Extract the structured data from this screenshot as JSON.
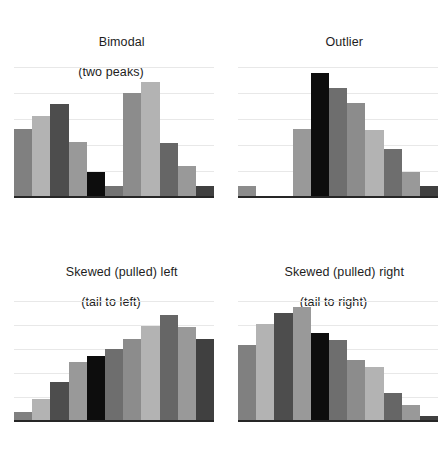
{
  "figure": {
    "background": "#ffffff",
    "axis_color": "#262626",
    "gridline_color": "#e8e8e8",
    "text_color": "#1d1d1d"
  },
  "palette": {
    "medium_gray": "#808080",
    "light_gray": "#b3b3b3",
    "dark_gray": "#4d4d4d",
    "black": "#0d0d0d"
  },
  "panels": [
    {
      "id": "bimodal",
      "title_line1": "Bimodal",
      "title_line2": "(two peaks)"
    },
    {
      "id": "outlier",
      "title_line1": "Outlier",
      "title_line2": ""
    },
    {
      "id": "skewed-left",
      "title_line1": "Skewed (pulled) left",
      "title_line2": "(tail to left)"
    },
    {
      "id": "skewed-right",
      "title_line1": "Skewed (pulled) right",
      "title_line2": "(tail to right)"
    }
  ],
  "chart_data": [
    {
      "type": "bar",
      "id": "bimodal",
      "title": "Bimodal (two peaks)",
      "xlabel": "",
      "ylabel": "",
      "ylim": [
        0,
        100
      ],
      "grid": true,
      "gridline_values": [
        20,
        40,
        60,
        80,
        100
      ],
      "legend": "none",
      "categories": [
        "1",
        "2",
        "3",
        "4",
        "5",
        "6",
        "7",
        "8",
        "9",
        "10"
      ],
      "values": [
        53,
        63,
        72,
        43,
        20,
        9,
        81,
        89,
        42,
        25,
        9
      ],
      "bars": [
        {
          "index": 1,
          "value": 53,
          "color": "#808080"
        },
        {
          "index": 2,
          "value": 63,
          "color": "#b3b3b3"
        },
        {
          "index": 3,
          "value": 72,
          "color": "#4d4d4d"
        },
        {
          "index": 4,
          "value": 43,
          "color": "#999999"
        },
        {
          "index": 5,
          "value": 20,
          "color": "#0d0d0d"
        },
        {
          "index": 6,
          "value": 9,
          "color": "#737373"
        },
        {
          "index": 7,
          "value": 81,
          "color": "#8c8c8c"
        },
        {
          "index": 8,
          "value": 89,
          "color": "#b3b3b3"
        },
        {
          "index": 9,
          "value": 42,
          "color": "#666666"
        },
        {
          "index": 10,
          "value": 25,
          "color": "#999999"
        },
        {
          "index": 11,
          "value": 9,
          "color": "#404040"
        }
      ]
    },
    {
      "type": "bar",
      "id": "outlier",
      "title": "Outlier",
      "xlabel": "",
      "ylabel": "",
      "ylim": [
        0,
        100
      ],
      "grid": true,
      "gridline_values": [
        20,
        40,
        60,
        80,
        100
      ],
      "legend": "none",
      "categories": [
        "1",
        "2",
        "3",
        "4",
        "5",
        "6",
        "7",
        "8",
        "9",
        "10"
      ],
      "values": [
        9,
        0,
        0,
        53,
        96,
        85,
        73,
        52,
        38,
        20,
        9
      ],
      "bars": [
        {
          "index": 1,
          "value": 9,
          "color": "#8c8c8c"
        },
        {
          "index": 2,
          "value": 0,
          "color": "#ffffff"
        },
        {
          "index": 3,
          "value": 0,
          "color": "#ffffff"
        },
        {
          "index": 4,
          "value": 53,
          "color": "#999999"
        },
        {
          "index": 5,
          "value": 96,
          "color": "#0d0d0d"
        },
        {
          "index": 6,
          "value": 85,
          "color": "#6e6e6e"
        },
        {
          "index": 7,
          "value": 73,
          "color": "#8c8c8c"
        },
        {
          "index": 8,
          "value": 52,
          "color": "#b3b3b3"
        },
        {
          "index": 9,
          "value": 38,
          "color": "#6e6e6e"
        },
        {
          "index": 10,
          "value": 20,
          "color": "#999999"
        },
        {
          "index": 11,
          "value": 9,
          "color": "#404040"
        }
      ]
    },
    {
      "type": "bar",
      "id": "skewed-left",
      "title": "Skewed (pulled) left (tail to left)",
      "xlabel": "",
      "ylabel": "",
      "ylim": [
        0,
        100
      ],
      "grid": true,
      "gridline_values": [
        20,
        40,
        60,
        80,
        100
      ],
      "legend": "none",
      "categories": [
        "1",
        "2",
        "3",
        "4",
        "5",
        "6",
        "7",
        "8",
        "9",
        "10"
      ],
      "values": [
        8,
        19,
        33,
        50,
        55,
        61,
        69,
        80,
        89,
        79,
        69
      ],
      "bars": [
        {
          "index": 1,
          "value": 8,
          "color": "#808080"
        },
        {
          "index": 2,
          "value": 19,
          "color": "#b3b3b3"
        },
        {
          "index": 3,
          "value": 33,
          "color": "#4d4d4d"
        },
        {
          "index": 4,
          "value": 50,
          "color": "#999999"
        },
        {
          "index": 5,
          "value": 55,
          "color": "#0d0d0d"
        },
        {
          "index": 6,
          "value": 61,
          "color": "#6e6e6e"
        },
        {
          "index": 7,
          "value": 69,
          "color": "#8c8c8c"
        },
        {
          "index": 8,
          "value": 80,
          "color": "#b3b3b3"
        },
        {
          "index": 9,
          "value": 89,
          "color": "#666666"
        },
        {
          "index": 10,
          "value": 79,
          "color": "#999999"
        },
        {
          "index": 11,
          "value": 69,
          "color": "#404040"
        }
      ]
    },
    {
      "type": "bar",
      "id": "skewed-right",
      "title": "Skewed (pulled) right (tail to right)",
      "xlabel": "",
      "ylabel": "",
      "ylim": [
        0,
        100
      ],
      "grid": true,
      "gridline_values": [
        20,
        40,
        60,
        80,
        100
      ],
      "legend": "none",
      "categories": [
        "1",
        "2",
        "3",
        "4",
        "5",
        "6",
        "7",
        "8",
        "9",
        "10"
      ],
      "values": [
        64,
        82,
        91,
        96,
        74,
        68,
        52,
        46,
        24,
        14,
        5
      ],
      "bars": [
        {
          "index": 1,
          "value": 64,
          "color": "#808080"
        },
        {
          "index": 2,
          "value": 82,
          "color": "#b3b3b3"
        },
        {
          "index": 3,
          "value": 91,
          "color": "#4d4d4d"
        },
        {
          "index": 4,
          "value": 96,
          "color": "#999999"
        },
        {
          "index": 5,
          "value": 74,
          "color": "#0d0d0d"
        },
        {
          "index": 6,
          "value": 68,
          "color": "#6e6e6e"
        },
        {
          "index": 7,
          "value": 52,
          "color": "#8c8c8c"
        },
        {
          "index": 8,
          "value": 46,
          "color": "#b3b3b3"
        },
        {
          "index": 9,
          "value": 24,
          "color": "#666666"
        },
        {
          "index": 10,
          "value": 14,
          "color": "#999999"
        },
        {
          "index": 11,
          "value": 5,
          "color": "#404040"
        }
      ]
    }
  ]
}
